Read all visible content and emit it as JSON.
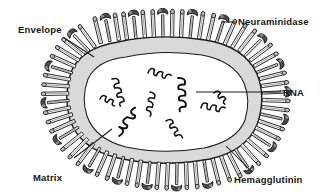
{
  "figure": {
    "background_color": "#ffffff",
    "line_color": "#1a1a1a",
    "envelope_fill": "#d9d9d9",
    "core_fill": "#ffffff",
    "spike_cap_fill": "#b5b5b5"
  },
  "labels": {
    "envelope": "Envelope",
    "neuraminidase": "Neuraminidase",
    "rna": "RNA",
    "hemagglutinin": "Hemagglutinin",
    "matrix_protein_line1": "Matrix",
    "matrix_protein_line2": "Protein"
  },
  "structures": {
    "envelope": {
      "name": "Envelope",
      "description": "outer lipid bilayer boundary of the virion"
    },
    "matrix_protein": {
      "name": "Matrix Protein",
      "description": "grey layer lining the inner face of the envelope"
    },
    "core": {
      "name": "Core",
      "description": "white interior enclosed by the matrix layer"
    },
    "rna": {
      "name": "RNA",
      "description": "coiled ribonucleoprotein segments inside the core",
      "segment_count": 9
    },
    "neuraminidase": {
      "name": "Neuraminidase",
      "description": "mushroom / T-shaped surface spike with a broad dark cap",
      "spike_count": 17
    },
    "hemagglutinin": {
      "name": "Hemagglutinin",
      "description": "narrow rod-shaped surface spike with a small rounded head",
      "spike_count": 54
    }
  },
  "leader_lines": {
    "envelope": "from label down-right to the envelope membrane at upper-left",
    "neuraminidase": "short horizontal line from label left to a mushroom spike",
    "rna": "horizontal line from label left into the RNA core",
    "hemagglutinin": "diagonal line from label up-left to a rod spike",
    "matrix_protein": "diagonal line from label up-right to the grey matrix layer"
  }
}
